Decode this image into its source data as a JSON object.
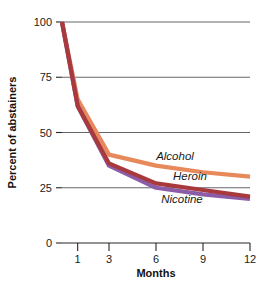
{
  "chart_data": {
    "type": "line",
    "title": "",
    "xlabel": "Months",
    "ylabel": "Percent of abstainers",
    "x": [
      0,
      1,
      3,
      6,
      9,
      12
    ],
    "x_tick_labels": [
      "1",
      "3",
      "6",
      "9",
      "12"
    ],
    "x_tick_values": [
      1,
      3,
      6,
      9,
      12
    ],
    "y_tick_labels": [
      "0",
      "25",
      "50",
      "75",
      "100"
    ],
    "y_tick_values": [
      0,
      25,
      50,
      75,
      100
    ],
    "ylim": [
      0,
      100
    ],
    "xlim": [
      0,
      12
    ],
    "grid": "horizontal",
    "legend_position": "inline-right",
    "series": [
      {
        "name": "Alcohol",
        "color": "#e8895c",
        "values": [
          100,
          65,
          40,
          35,
          32,
          30
        ]
      },
      {
        "name": "Heroin",
        "color": "#a8393c",
        "values": [
          100,
          62,
          36,
          27,
          24,
          21
        ]
      },
      {
        "name": "Nicotine",
        "color": "#8b5ca8",
        "values": [
          100,
          62,
          35,
          25,
          22,
          20
        ]
      }
    ],
    "annotations": [
      {
        "text": "Alcohol",
        "series": "Alcohol"
      },
      {
        "text": "Heroin",
        "series": "Heroin"
      },
      {
        "text": "Nicotine",
        "series": "Nicotine"
      }
    ]
  },
  "axes": {
    "x_title": "Months",
    "y_title": "Percent of abstainers",
    "y_labels": [
      "100",
      "75",
      "50",
      "25",
      "0"
    ],
    "x_labels": [
      "1",
      "3",
      "6",
      "9",
      "12"
    ]
  },
  "series_labels": {
    "alcohol": "Alcohol",
    "heroin": "Heroin",
    "nicotine": "Nicotine"
  },
  "colors": {
    "alcohol": "#e8895c",
    "heroin": "#a8393c",
    "nicotine": "#8b5ca8",
    "grid": "#55555c",
    "axis": "#262626",
    "text": "#1a1a1a"
  }
}
